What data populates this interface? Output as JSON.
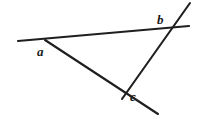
{
  "figure": {
    "kind": "geometry-diagram",
    "background_color": "#ffffff",
    "stroke_color": "#1f1f1f",
    "label_color": "#1a1a1a",
    "canvas": {
      "width": 197,
      "height": 119
    },
    "vertices": [
      {
        "id": "a",
        "label": "a",
        "x": 47,
        "y": 42
      },
      {
        "id": "b",
        "label": "b",
        "x": 169,
        "y": 30
      },
      {
        "id": "c",
        "label": "c",
        "x": 126,
        "y": 94
      }
    ],
    "segments": [
      {
        "id": "line-a-b",
        "name": "top-line-through-a-and-b",
        "x1": 18,
        "y1": 41,
        "x2": 189,
        "y2": 26,
        "stroke_width": 2.1,
        "note": "passes through vertex a at (47,42) and vertex b at (169,30); extends left past a to the canvas edge"
      },
      {
        "id": "line-a-c",
        "name": "line-through-a-and-c",
        "x1": 45,
        "y1": 40,
        "x2": 158,
        "y2": 114,
        "stroke_width": 2.1,
        "note": "passes through vertex a at (47,42) and vertex c at (126,94); extends down-right past c toward the bottom edge"
      },
      {
        "id": "line-c-b",
        "name": "line-through-c-and-b",
        "x1": 122,
        "y1": 99,
        "x2": 190,
        "y2": 3,
        "stroke_width": 2.1,
        "note": "passes through vertex c at (126,94) and vertex b at (169,30); extends up-right past b to the top-right corner"
      }
    ],
    "labels": [
      {
        "id": "label-a",
        "text": "a",
        "x": 37,
        "y": 45,
        "anchor_vertex": "a",
        "placement": "below-left-of-vertex"
      },
      {
        "id": "label-b",
        "text": "b",
        "x": 157,
        "y": 13,
        "anchor_vertex": "b",
        "placement": "above-left-of-vertex"
      },
      {
        "id": "label-c",
        "text": "c",
        "x": 130,
        "y": 90,
        "anchor_vertex": "c",
        "placement": "right-of-vertex"
      }
    ]
  }
}
